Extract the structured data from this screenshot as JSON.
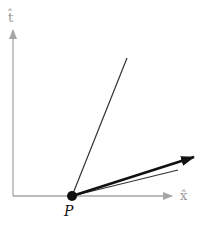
{
  "diagram": {
    "axes": {
      "vertical_label": "t̂",
      "horizontal_label": "x̂",
      "color": "#a6a6a6"
    },
    "point": {
      "label": "P",
      "color": "#111111"
    },
    "lines": [
      {
        "name": "steep-line",
        "color": "#333333"
      },
      {
        "name": "shallow-line",
        "color": "#333333"
      },
      {
        "name": "vector-arrow",
        "color": "#111111"
      }
    ]
  }
}
